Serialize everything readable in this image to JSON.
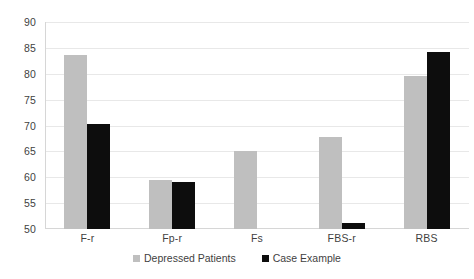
{
  "chart_data": {
    "type": "bar",
    "title": "",
    "xlabel": "",
    "ylabel": "",
    "ylim": [
      50,
      90
    ],
    "yticks": [
      50,
      55,
      60,
      65,
      70,
      75,
      80,
      85,
      90
    ],
    "grid": true,
    "legend_position": "bottom",
    "categories": [
      "F-r",
      "Fp-r",
      "Fs",
      "FBS-r",
      "RBS"
    ],
    "series": [
      {
        "name": "Depressed Patients",
        "color": "#BFBFBF",
        "values": [
          83.6,
          59.4,
          65.1,
          67.7,
          79.5
        ]
      },
      {
        "name": "Case Example",
        "color": "#0D0D0D",
        "values": [
          70.2,
          59.0,
          null,
          51.1,
          84.2
        ]
      }
    ]
  },
  "legend": {
    "items": [
      {
        "label": "Depressed Patients",
        "color": "#BFBFBF"
      },
      {
        "label": "Case Example",
        "color": "#0D0D0D"
      }
    ]
  },
  "axis": {
    "y_tick_labels": [
      "90",
      "85",
      "80",
      "75",
      "70",
      "65",
      "60",
      "55",
      "50"
    ],
    "x_tick_labels": [
      "F-r",
      "Fp-r",
      "Fs",
      "FBS-r",
      "RBS"
    ]
  }
}
